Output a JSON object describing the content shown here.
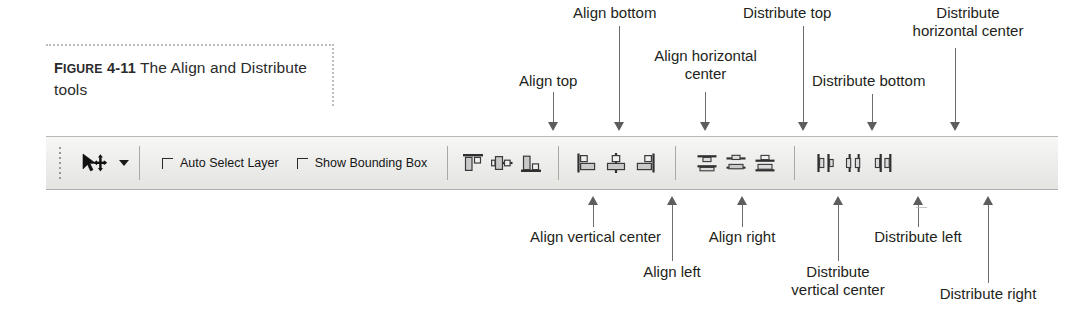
{
  "figure": {
    "label_prefix": "F",
    "label_small": "IGURE",
    "label_number": " 4-11",
    "caption": "  The Align and Distribute tools"
  },
  "toolbar": {
    "grip_name": "toolbar-grip",
    "move_tool": {
      "icon": "move-tool-icon",
      "dropdown": "tool-preset-dropdown-arrow"
    },
    "checkboxes": [
      {
        "label": "Auto Select Layer",
        "checked": false
      },
      {
        "label": "Show Bounding Box",
        "checked": false
      }
    ],
    "align_group_1": [
      {
        "name": "align-top-button",
        "icon": "align-top-icon"
      },
      {
        "name": "align-vertical-center-button",
        "icon": "align-vertical-center-icon"
      },
      {
        "name": "align-bottom-button",
        "icon": "align-bottom-icon"
      }
    ],
    "align_group_2": [
      {
        "name": "align-left-button",
        "icon": "align-left-icon"
      },
      {
        "name": "align-horizontal-center-button",
        "icon": "align-horizontal-center-icon"
      },
      {
        "name": "align-right-button",
        "icon": "align-right-icon"
      }
    ],
    "distribute_group_1": [
      {
        "name": "distribute-top-button",
        "icon": "distribute-top-icon"
      },
      {
        "name": "distribute-vertical-center-button",
        "icon": "distribute-vertical-center-icon"
      },
      {
        "name": "distribute-bottom-button",
        "icon": "distribute-bottom-icon"
      }
    ],
    "distribute_group_2": [
      {
        "name": "distribute-left-button",
        "icon": "distribute-left-icon"
      },
      {
        "name": "distribute-horizontal-center-button",
        "icon": "distribute-horizontal-center-icon"
      },
      {
        "name": "distribute-right-button",
        "icon": "distribute-right-icon"
      }
    ]
  },
  "callouts": {
    "align_top": "Align top",
    "align_bottom": "Align bottom",
    "align_horizontal_center": "Align horizontal\ncenter",
    "distribute_top": "Distribute top",
    "distribute_bottom": "Distribute bottom",
    "distribute_horizontal_center": "Distribute\nhorizontal center",
    "align_vertical_center": "Align vertical center",
    "align_left": "Align left",
    "align_right": "Align right",
    "distribute_vertical_center": "Distribute\nvertical center",
    "distribute_left": "Distribute left",
    "distribute_right": "Distribute right"
  },
  "colors": {
    "text": "#231f20",
    "leader": "#5d5d5d",
    "toolbar_bg": "#ececea",
    "toolbar_border": "#b0b0ac"
  }
}
